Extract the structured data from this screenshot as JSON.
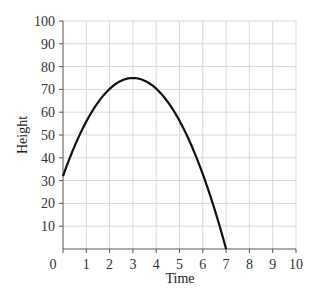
{
  "chart_data": {
    "type": "line",
    "title": "",
    "xlabel": "Time",
    "ylabel": "Height",
    "xlim": [
      0,
      10
    ],
    "ylim": [
      0,
      100
    ],
    "x_ticks": [
      0,
      1,
      2,
      3,
      4,
      5,
      6,
      7,
      8,
      9,
      10
    ],
    "y_ticks": [
      10,
      20,
      30,
      40,
      50,
      60,
      70,
      80,
      90,
      100
    ],
    "grid": true,
    "legend": null,
    "series": [
      {
        "name": "height",
        "description": "Parabolic curve starting near (0, 32), peaking at (3, 75), reaching 0 at t = 7",
        "x": [
          0,
          0.5,
          1,
          1.5,
          2,
          2.5,
          3,
          3.5,
          4,
          4.5,
          5,
          5.5,
          6,
          6.5,
          7
        ],
        "y": [
          32,
          45.7,
          56.3,
          64.5,
          70.3,
          73.8,
          75,
          73.8,
          70.3,
          64.5,
          56.3,
          45.7,
          32.8,
          17.6,
          0
        ]
      }
    ]
  }
}
